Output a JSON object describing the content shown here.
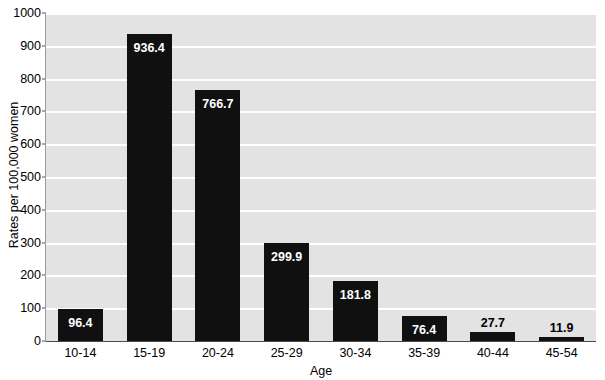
{
  "chart_data": {
    "type": "bar",
    "title": "",
    "xlabel": "Age",
    "ylabel": "Rates per 100,000 women",
    "categories": [
      "10-14",
      "15-19",
      "20-24",
      "25-29",
      "30-34",
      "35-39",
      "40-44",
      "45-54"
    ],
    "values": [
      96.4,
      936.4,
      766.7,
      299.9,
      181.8,
      76.4,
      27.7,
      11.9
    ],
    "value_labels": [
      "96.4",
      "936.4",
      "766.7",
      "299.9",
      "181.8",
      "76.4",
      "27.7",
      "11.9"
    ],
    "label_placement": [
      "inside",
      "inside",
      "inside",
      "inside",
      "inside",
      "inside",
      "outside",
      "outside"
    ],
    "ylim": [
      0,
      1000
    ],
    "ytick_labels": [
      "1000",
      "900",
      "800",
      "700",
      "600",
      "500",
      "400",
      "300",
      "200",
      "100",
      "0"
    ],
    "ytick_values": [
      1000,
      900,
      800,
      700,
      600,
      500,
      400,
      300,
      200,
      100,
      0
    ],
    "grid": true,
    "legend": null,
    "bar_color": "#101010",
    "plot_background": "#e3e3e3",
    "gridline_color": "#ffffff"
  },
  "title_remnant": "",
  "axis": {
    "x_title": "Age",
    "y_title": "Rates per 100,000 women"
  }
}
